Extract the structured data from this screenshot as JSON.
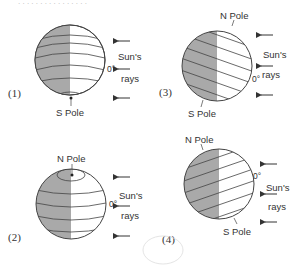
{
  "header_fragment": "...",
  "colors": {
    "night": "#a9a9a9",
    "day": "#ffffff",
    "line": "#444444"
  },
  "diagrams": [
    {
      "id": "1",
      "label": "(1)",
      "pole_label": "S Pole",
      "sun_label_1": "Sun's",
      "sun_label_2": "rays",
      "equator_label": "0°"
    },
    {
      "id": "2",
      "label": "(2)",
      "pole_label": "N Pole",
      "sun_label_1": "Sun's",
      "sun_label_2": "rays",
      "equator_label": "0°"
    },
    {
      "id": "3",
      "label": "(3)",
      "pole_top_label": "N Pole",
      "pole_bottom_label": "S Pole",
      "sun_label_1": "Sun's",
      "sun_label_2": "rays",
      "equator_label": "0°"
    },
    {
      "id": "4",
      "label": "(4)",
      "pole_top_label": "N Pole",
      "pole_bottom_label": "S Pole",
      "sun_label_1": "Sun's",
      "sun_label_2": "rays",
      "equator_label": "0°"
    }
  ]
}
